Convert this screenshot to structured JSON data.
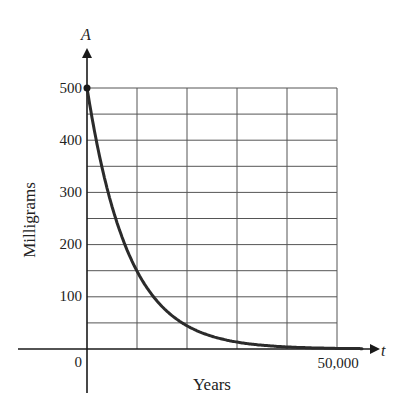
{
  "chart_data": {
    "type": "line",
    "title": "",
    "xlabel": "Years",
    "ylabel": "Milligrams",
    "x_variable": "t",
    "y_variable": "A",
    "xlim": [
      0,
      50000
    ],
    "ylim": [
      0,
      500
    ],
    "x_ticks": [
      0,
      10000,
      20000,
      30000,
      40000,
      50000
    ],
    "x_tick_labels": [
      "0",
      "50,000"
    ],
    "y_ticks": [
      0,
      50,
      100,
      150,
      200,
      250,
      300,
      350,
      400,
      450,
      500
    ],
    "y_tick_labels": [
      "0",
      "100",
      "200",
      "300",
      "400",
      "500"
    ],
    "grid": true,
    "legend": null,
    "series": [
      {
        "name": "A(t)",
        "description": "Exponential decay starting at 500 mg (half-life ≈ 5,730 years)",
        "x": [
          0,
          2500,
          5000,
          7500,
          10000,
          12500,
          15000,
          17500,
          20000,
          25000,
          30000,
          35000,
          40000,
          45000,
          50000
        ],
        "y": [
          500,
          369,
          273,
          202,
          149,
          110,
          81,
          60,
          45,
          24,
          13,
          7,
          4,
          2,
          1
        ]
      }
    ],
    "annotations": [
      {
        "type": "point",
        "x": 0,
        "y": 500,
        "label": "initial amount dot"
      }
    ]
  },
  "labels": {
    "y_var": "A",
    "x_var": "t",
    "y_title": "Milligrams",
    "x_title": "Years",
    "y500": "500",
    "y400": "400",
    "y300": "300",
    "y200": "200",
    "y100": "100",
    "origin": "0",
    "x_end": "50,000"
  },
  "colors": {
    "curve": "#2b2b2b",
    "grid": "#555555",
    "axis": "#1a1a1a"
  }
}
